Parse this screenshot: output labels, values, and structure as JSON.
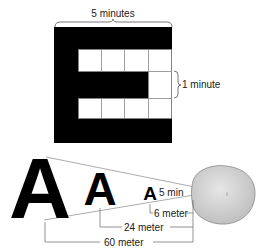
{
  "top_figure": {
    "width_label": "5 minutes",
    "cell_label": "1 minute",
    "letter": "E",
    "grid": {
      "rows": 5,
      "cols": 5
    }
  },
  "bottom_figure": {
    "letters": [
      "A",
      "A",
      "A"
    ],
    "angle_label": "5 min",
    "distances": [
      "6 meter",
      "24 meter",
      "60 meter"
    ]
  },
  "colors": {
    "ink": "#000000",
    "line": "#777777",
    "eye_fill": "#d2d2d2",
    "eye_stroke": "#888888"
  }
}
